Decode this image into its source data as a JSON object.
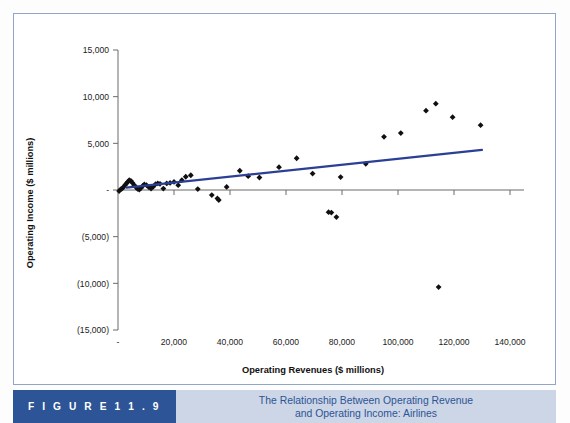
{
  "figure": {
    "badge_label": "F I G U R E   1 1 . 9",
    "caption_line1": "The Relationship Between Operating Revenue",
    "caption_line2": "and Operating Income: Airlines",
    "badge_color": "#2d5496",
    "caption_bg": "#ccd6e6",
    "caption_text_color": "#2d5496",
    "border_color": "#8fa6c4"
  },
  "chart_data": {
    "type": "scatter",
    "title": "The Relationship Between Operating Revenue and Operating Income: Airlines",
    "xlabel": "Operating Revenues ($ millions)",
    "ylabel": "Operating Income ($ millions)",
    "xlim": [
      0,
      140000
    ],
    "ylim": [
      -15000,
      15000
    ],
    "grid": false,
    "legend": "none",
    "marker_color": "#101010",
    "marker_shape": "diamond",
    "trendline_color": "#2b3f96",
    "xticks": [
      0,
      20000,
      40000,
      60000,
      80000,
      100000,
      120000,
      140000
    ],
    "xtick_labels": [
      "-",
      "20,000",
      "40,000",
      "60,000",
      "80,000",
      "100,000",
      "120,000",
      "140,000"
    ],
    "yticks": [
      15000,
      10000,
      5000,
      0,
      -5000,
      -10000,
      -15000
    ],
    "ytick_labels": [
      "15,000",
      "10,000",
      "5,000",
      "-",
      "(5,000)",
      "(10,000)",
      "(15,000)"
    ],
    "trendline": {
      "x": [
        3000,
        130000
      ],
      "y": [
        250,
        4300
      ]
    },
    "points": [
      {
        "x": 400,
        "y": -120
      },
      {
        "x": 900,
        "y": 60
      },
      {
        "x": 1400,
        "y": 140
      },
      {
        "x": 2000,
        "y": 320
      },
      {
        "x": 2500,
        "y": 520
      },
      {
        "x": 3000,
        "y": 700
      },
      {
        "x": 3500,
        "y": 880
      },
      {
        "x": 4000,
        "y": 1050
      },
      {
        "x": 4600,
        "y": 980
      },
      {
        "x": 5200,
        "y": 760
      },
      {
        "x": 5800,
        "y": 520
      },
      {
        "x": 6400,
        "y": 300
      },
      {
        "x": 7000,
        "y": 120
      },
      {
        "x": 7600,
        "y": 40
      },
      {
        "x": 8200,
        "y": 220
      },
      {
        "x": 8800,
        "y": 430
      },
      {
        "x": 9400,
        "y": 600
      },
      {
        "x": 10200,
        "y": 520
      },
      {
        "x": 11000,
        "y": 300
      },
      {
        "x": 11800,
        "y": 150
      },
      {
        "x": 12600,
        "y": 360
      },
      {
        "x": 13400,
        "y": 620
      },
      {
        "x": 14200,
        "y": 700
      },
      {
        "x": 15000,
        "y": 660
      },
      {
        "x": 16200,
        "y": 150
      },
      {
        "x": 17400,
        "y": 700
      },
      {
        "x": 18600,
        "y": 760
      },
      {
        "x": 20000,
        "y": 860
      },
      {
        "x": 21500,
        "y": 520
      },
      {
        "x": 22800,
        "y": 1050
      },
      {
        "x": 24200,
        "y": 1420
      },
      {
        "x": 26000,
        "y": 1580
      },
      {
        "x": 28500,
        "y": 100
      },
      {
        "x": 33500,
        "y": -540
      },
      {
        "x": 35500,
        "y": -900
      },
      {
        "x": 36000,
        "y": -1080
      },
      {
        "x": 38800,
        "y": 330
      },
      {
        "x": 43500,
        "y": 2060
      },
      {
        "x": 46500,
        "y": 1480
      },
      {
        "x": 50500,
        "y": 1340
      },
      {
        "x": 57500,
        "y": 2450
      },
      {
        "x": 63800,
        "y": 3400
      },
      {
        "x": 69500,
        "y": 1760
      },
      {
        "x": 75200,
        "y": -2380
      },
      {
        "x": 76200,
        "y": -2420
      },
      {
        "x": 78000,
        "y": -2900
      },
      {
        "x": 79500,
        "y": 1380
      },
      {
        "x": 88500,
        "y": 2800
      },
      {
        "x": 95000,
        "y": 5700
      },
      {
        "x": 101000,
        "y": 6100
      },
      {
        "x": 110000,
        "y": 8500
      },
      {
        "x": 113500,
        "y": 9250
      },
      {
        "x": 114500,
        "y": -10400
      },
      {
        "x": 119500,
        "y": 7800
      },
      {
        "x": 129500,
        "y": 6950
      }
    ]
  }
}
